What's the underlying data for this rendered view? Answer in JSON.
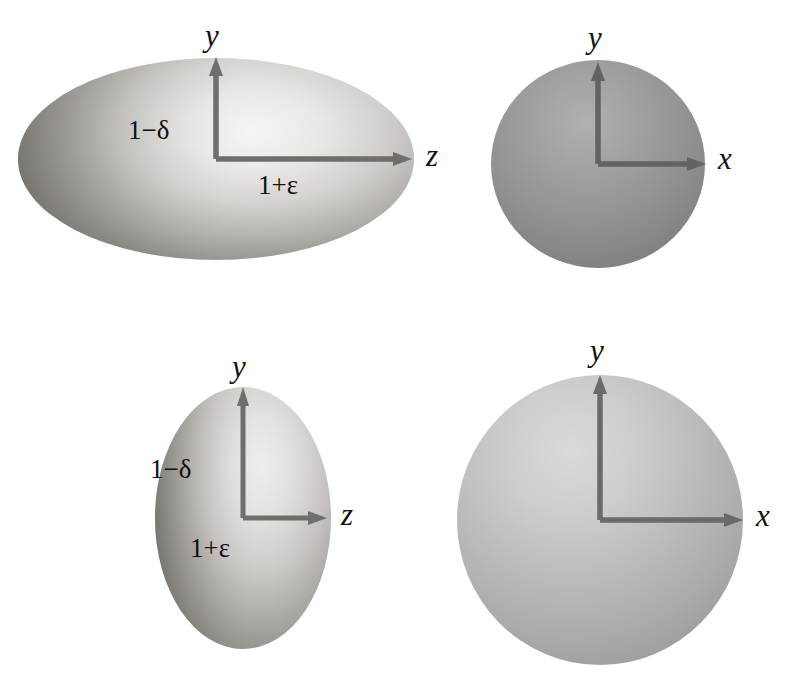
{
  "figure": {
    "background_color": "#ffffff",
    "axis_arrow_color": "#6e6e6e",
    "label_color": "#111111",
    "width": 804,
    "height": 688
  },
  "panels": [
    {
      "id": "top-left",
      "shape": "oblate-ellipsoid-zy",
      "description": "Horizontally elongated ellipse, z-y cross-section",
      "fill_light": "#f2f0ee",
      "fill_mid": "#bdbab6",
      "fill_dark": "#6f6c69",
      "center": {
        "x": 216,
        "y": 159
      },
      "radius_x": 198,
      "radius_y": 101,
      "axes": {
        "vertical": {
          "label": "y",
          "length": 100
        },
        "horizontal": {
          "label": "z",
          "length": 200
        }
      },
      "labels": {
        "vertical_axis": "y",
        "horizontal_axis": "z",
        "minor": "1−δ",
        "major": "1+ε"
      }
    },
    {
      "id": "top-right",
      "shape": "circle-xy",
      "description": "Circular cross-section, x-y plane, darker uniform sphere",
      "fill_light": "#a9a7a4",
      "fill_mid": "#8e8c89",
      "fill_dark": "#757371",
      "center": {
        "x": 598,
        "y": 164
      },
      "radius_x": 107,
      "radius_y": 104,
      "axes": {
        "vertical": {
          "label": "y",
          "length": 103
        },
        "horizontal": {
          "label": "x",
          "length": 110
        }
      },
      "labels": {
        "vertical_axis": "y",
        "horizontal_axis": "x"
      }
    },
    {
      "id": "bottom-left",
      "shape": "prolate-ellipsoid-zy",
      "description": "Vertically elongated ellipse, z-y cross-section",
      "fill_light": "#e9e7e4",
      "fill_mid": "#bab7b3",
      "fill_dark": "#76736f",
      "center": {
        "x": 243,
        "y": 518
      },
      "radius_x": 88,
      "radius_y": 131,
      "axes": {
        "vertical": {
          "label": "y",
          "length": 132
        },
        "horizontal": {
          "label": "z",
          "length": 88
        }
      },
      "labels": {
        "vertical_axis": "y",
        "horizontal_axis": "z",
        "minor": "1−δ",
        "major": "1+ε"
      }
    },
    {
      "id": "bottom-right",
      "shape": "circle-xy",
      "description": "Circular cross-section, x-y plane, lighter large sphere",
      "fill_light": "#d8d6d3",
      "fill_mid": "#b6b4b1",
      "fill_dark": "#9a9895",
      "center": {
        "x": 600,
        "y": 520
      },
      "radius_x": 143,
      "radius_y": 145,
      "axes": {
        "vertical": {
          "label": "y",
          "length": 144
        },
        "horizontal": {
          "label": "x",
          "length": 146
        }
      },
      "labels": {
        "vertical_axis": "y",
        "horizontal_axis": "x"
      }
    }
  ]
}
